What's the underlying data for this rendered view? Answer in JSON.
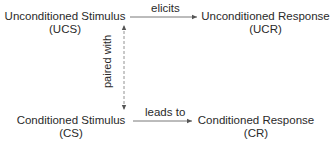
{
  "diagram": {
    "nodes": {
      "ucs": {
        "title": "Unconditioned Stimulus",
        "abbr": "(UCS)"
      },
      "ucr": {
        "title": "Unconditioned Response",
        "abbr": "(UCR)"
      },
      "cs": {
        "title": "Conditioned Stimulus",
        "abbr": "(CS)"
      },
      "cr": {
        "title": "Conditioned Response",
        "abbr": "(CR)"
      }
    },
    "edges": {
      "ucs_to_ucr": {
        "label": "elicits",
        "style": "solid"
      },
      "cs_to_cr": {
        "label": "leads to",
        "style": "solid"
      },
      "ucs_cs": {
        "label": "paired with",
        "style": "dashed",
        "direction": "bidirectional"
      }
    },
    "colors": {
      "text": "#2a2a2a",
      "line": "#555555",
      "background": "#ffffff"
    }
  }
}
